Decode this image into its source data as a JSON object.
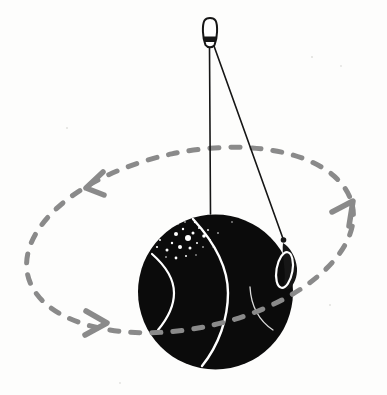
{
  "colors": {
    "background": "#fdfdfc",
    "ink": "#161616",
    "ball_fill": "#0b0b0b",
    "path_gray": "#8a8a8a",
    "white": "#ffffff"
  },
  "illustration": {
    "elements": [
      {
        "name": "ceiling-hook-icon",
        "shape": "screw-eye loop at top anchor"
      },
      {
        "name": "vertical-string",
        "shape": "thin line from hook straight down to top of ball"
      },
      {
        "name": "swing-string",
        "shape": "thin line from hook diagonally to whirling weight"
      },
      {
        "name": "ball",
        "shape": "large black sphere with white highlight arcs and speckles"
      },
      {
        "name": "circular-path",
        "shape": "gray dashed tilted ellipse around the ball"
      },
      {
        "name": "path-arrow-top-left",
        "direction": "left-down"
      },
      {
        "name": "path-arrow-bottom-left",
        "direction": "right"
      },
      {
        "name": "path-arrow-right",
        "direction": "up-right"
      },
      {
        "name": "swivel-weight-icon",
        "shape": "small dark weight with white loop riding the dashed path"
      }
    ]
  }
}
